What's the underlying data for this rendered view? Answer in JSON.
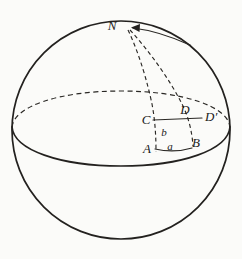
{
  "figure": {
    "name": "sphere-spherical-triangle-diagram",
    "background_color": "#fbfbf9",
    "line_color": "#23211f",
    "width": 242,
    "height": 259
  },
  "labels": {
    "north_pole": "N",
    "vertex_a": "A",
    "vertex_b": "B",
    "vertex_c": "C",
    "vertex_d": "D",
    "vertex_d_prime": "D′",
    "side_a": "a",
    "side_b": "b"
  },
  "elements": {
    "sphere_outline": "sphere-circle",
    "equator_front": "equator-front-arc-solid",
    "equator_back": "equator-back-arc-dashed",
    "meridian_left": "meridian-through-A-C",
    "meridian_right": "meridian-through-B-D",
    "pole_arrow": "arrow-to-north-pole",
    "horizontal_cd": "horizontal-line-C-to-D-prime",
    "base_ab": "base-arc-A-to-B"
  },
  "geometry": {
    "circle_center_x": 121,
    "circle_center_y": 130,
    "circle_radius": 109,
    "equator_ry": 36,
    "pole_x": 126,
    "pole_y": 27
  }
}
